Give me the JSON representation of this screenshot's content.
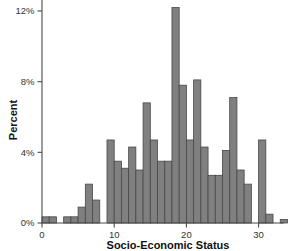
{
  "chart_data": {
    "type": "bar",
    "title": "",
    "xlabel": "Socio-Economic Status",
    "ylabel": "Percent",
    "xlim": [
      0,
      33.5
    ],
    "ylim": [
      0,
      12.8
    ],
    "grid": false,
    "legend": null,
    "bin_width": 1,
    "xticks": [
      0,
      10,
      20,
      30
    ],
    "xtick_labels": [
      "0",
      "10",
      "20",
      "30"
    ],
    "yticks": [
      0,
      4,
      8,
      12
    ],
    "ytick_labels": [
      "0%",
      "4%",
      "8%",
      "12%"
    ],
    "bar_color": "#808080",
    "bar_edge_color": "#474747",
    "axis_color": "#4a4a4a",
    "categories": [
      0,
      1,
      2,
      3,
      4,
      5,
      6,
      7,
      8,
      9,
      10,
      11,
      12,
      13,
      14,
      15,
      16,
      17,
      18,
      19,
      20,
      21,
      22,
      23,
      24,
      25,
      26,
      27,
      28,
      29,
      30,
      31,
      32,
      33
    ],
    "values": [
      0.35,
      0.35,
      0.0,
      0.35,
      0.35,
      0.9,
      2.2,
      1.3,
      0.0,
      4.7,
      3.5,
      3.1,
      4.3,
      3.0,
      6.8,
      4.7,
      3.5,
      3.5,
      12.2,
      7.8,
      4.7,
      8.1,
      4.3,
      2.7,
      2.7,
      4.1,
      7.1,
      3.0,
      2.2,
      0.0,
      4.7,
      0.5,
      0.0,
      0.2
    ]
  },
  "labels": {
    "ylabel": "Percent",
    "xlabel": "Socio-Economic Status"
  }
}
